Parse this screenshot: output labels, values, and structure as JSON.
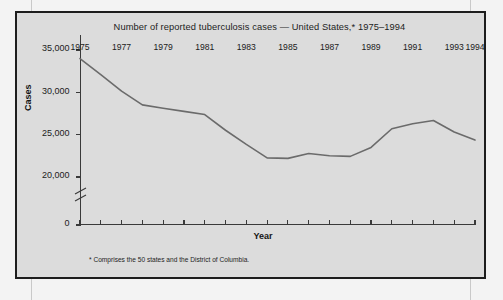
{
  "figure": {
    "title": "Number of reported tuberculosis cases — United States,* 1975–1994",
    "footnote": "* Comprises the 50 states and the District of Columbia.",
    "x_axis_title": "Year",
    "y_axis_title": "Cases",
    "line_color": "#6b6b6b",
    "axis_color": "#3a3a3a",
    "panel_color": "#dcdcdc",
    "page_color": "#f3f3f3"
  },
  "chart_data": {
    "type": "line",
    "title": "Number of reported tuberculosis cases — United States,* 1975–1994",
    "xlabel": "Year",
    "ylabel": "Cases",
    "xlim": [
      1975,
      1994
    ],
    "ylim": [
      19000,
      35000
    ],
    "y_axis_break": true,
    "grid": false,
    "legend": null,
    "x": [
      1975,
      1976,
      1977,
      1978,
      1979,
      1980,
      1981,
      1982,
      1983,
      1984,
      1985,
      1986,
      1987,
      1988,
      1989,
      1990,
      1991,
      1992,
      1993,
      1994
    ],
    "values": [
      33989,
      32105,
      30145,
      28521,
      28130,
      27749,
      27373,
      25520,
      23846,
      22255,
      22201,
      22768,
      22517,
      22436,
      23495,
      25701,
      26283,
      26673,
      25313,
      24361
    ],
    "y_ticks": [
      0,
      20000,
      25000,
      30000,
      35000
    ],
    "y_tick_labels": [
      "0",
      "20,000",
      "25,000",
      "30,000",
      "35,000"
    ],
    "x_ticks": [
      1975,
      1976,
      1977,
      1978,
      1979,
      1980,
      1981,
      1982,
      1983,
      1984,
      1985,
      1986,
      1987,
      1988,
      1989,
      1990,
      1991,
      1992,
      1993,
      1994
    ],
    "x_tick_labels": [
      "1975",
      "",
      "1977",
      "",
      "1979",
      "",
      "1981",
      "",
      "1983",
      "",
      "1985",
      "",
      "1987",
      "",
      "1989",
      "",
      "1991",
      "",
      "1993",
      "1994"
    ],
    "series": [
      {
        "name": "Reported tuberculosis cases",
        "points": [
          {
            "year": 1975,
            "cases": 33989
          },
          {
            "year": 1976,
            "cases": 32105
          },
          {
            "year": 1977,
            "cases": 30145
          },
          {
            "year": 1978,
            "cases": 28521
          },
          {
            "year": 1979,
            "cases": 28130
          },
          {
            "year": 1980,
            "cases": 27749
          },
          {
            "year": 1981,
            "cases": 27373
          },
          {
            "year": 1982,
            "cases": 25520
          },
          {
            "year": 1983,
            "cases": 23846
          },
          {
            "year": 1984,
            "cases": 22255
          },
          {
            "year": 1985,
            "cases": 22201
          },
          {
            "year": 1986,
            "cases": 22768
          },
          {
            "year": 1987,
            "cases": 22517
          },
          {
            "year": 1988,
            "cases": 22436
          },
          {
            "year": 1989,
            "cases": 23495
          },
          {
            "year": 1990,
            "cases": 25701
          },
          {
            "year": 1991,
            "cases": 26283
          },
          {
            "year": 1992,
            "cases": 26673
          },
          {
            "year": 1993,
            "cases": 25313
          },
          {
            "year": 1994,
            "cases": 24361
          }
        ]
      }
    ]
  }
}
